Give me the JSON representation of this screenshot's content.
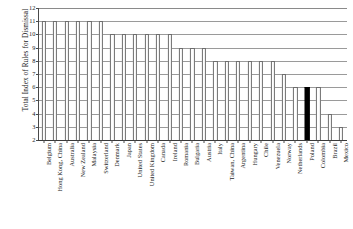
{
  "chart_data": {
    "type": "bar",
    "title": "",
    "xlabel": "",
    "ylabel": "Total Index of Rules for Dismissal",
    "ylim": [
      2,
      12
    ],
    "yticks": [
      2,
      3,
      4,
      5,
      6,
      7,
      8,
      9,
      10,
      11,
      12
    ],
    "grid": true,
    "legend": "none",
    "highlight_category": "Poland",
    "highlight_color": "#000000",
    "bar_color": "#ffffff",
    "bar_edge_color": "#6e6e6e",
    "categories": [
      "Belgium",
      "Hong Kong, China",
      "Australia",
      "New Zealand",
      "Malaysia",
      "Switzerland",
      "Denmark",
      "Japan",
      "United States",
      "United Kingdom",
      "Canada",
      "Ireland",
      "Romania",
      "Bulgaria",
      "Austria",
      "Italy",
      "Taiwan, China",
      "Argentina",
      "Hungary",
      "Chile",
      "Venezuela",
      "Norway",
      "Netherlands",
      "Poland",
      "Colombia",
      "Brazil",
      "Mexico"
    ],
    "values": [
      11,
      11,
      11,
      11,
      11,
      11,
      10,
      10,
      10,
      10,
      10,
      10,
      9,
      9,
      9,
      8,
      8,
      8,
      8,
      8,
      8,
      7,
      6,
      6,
      6,
      4,
      3
    ]
  }
}
